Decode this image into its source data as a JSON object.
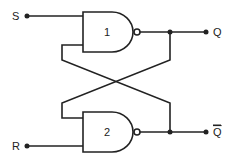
{
  "diagram": {
    "inputs": [
      {
        "label": "S"
      },
      {
        "label": "R"
      }
    ],
    "outputs": [
      {
        "label": "Q"
      },
      {
        "label": "Q",
        "overline": true
      }
    ],
    "gates": [
      {
        "number": "1",
        "type": "NAND"
      },
      {
        "number": "2",
        "type": "NAND"
      }
    ],
    "colors": {
      "line": "#222222",
      "background": "#ffffff"
    }
  }
}
